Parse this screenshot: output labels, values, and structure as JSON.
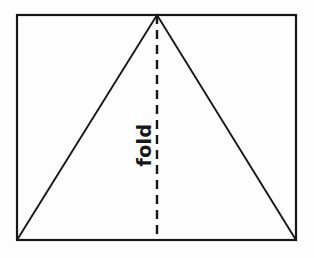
{
  "figure": {
    "background_color": "#fdfdfd",
    "ink_color": "#17171a",
    "canvas": {
      "width": 314,
      "height": 258
    },
    "sheet": {
      "name": "paper-sheet-rectangle",
      "x": 17,
      "y": 15,
      "width": 279,
      "height": 225,
      "stroke_width": 2.2,
      "stroke_color": "#17171a",
      "fill_color": "#fdfdfd"
    },
    "triangle": {
      "name": "inscribed-triangle",
      "apex": {
        "x": 157,
        "y": 15
      },
      "bottom_left": {
        "x": 17,
        "y": 240
      },
      "bottom_right": {
        "x": 296,
        "y": 240
      },
      "stroke_width": 1.9,
      "stroke_color": "#17171a",
      "fill_color": "none"
    },
    "fold_line": {
      "name": "fold-crease-dashed-line",
      "x": 157,
      "y_start": 15,
      "y_end": 240,
      "stroke_width": 2.4,
      "stroke_color": "#17171a",
      "dash_length": 9,
      "gap_length": 6,
      "style": "dashed"
    },
    "fold_label": {
      "name": "fold-label",
      "text": "fold",
      "x": 145,
      "y": 145,
      "rotation_degrees": -90,
      "font_size": 19,
      "color": "#17171a"
    }
  }
}
